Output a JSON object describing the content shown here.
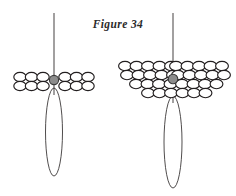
{
  "caption": {
    "text": "Figure 34"
  },
  "colors": {
    "background": "#ffffff",
    "ink": "#231f20",
    "bead_outline": "#231f20",
    "bead_fill": "#ffffff",
    "center_bead_fill": "#8c8c8c",
    "center_bead_outline": "#3a3a3a",
    "caption_text": "#2b2b2b"
  },
  "figures": [
    {
      "id": "left-figure",
      "name": "small-beadwork-motif",
      "stem": {
        "x": 54,
        "y_top": 13,
        "y_bottom": 95
      },
      "center_bead": {
        "cx": 54,
        "cy": 80,
        "r": 4.6
      },
      "loop": {
        "cx": 54,
        "cy": 132,
        "rx": 8.5,
        "ry": 44
      },
      "bead_rows": [
        {
          "row": 1,
          "cy": 77,
          "rx": 6.2,
          "ry": 4.6,
          "bead_count": 6,
          "centers_x": [
            20,
            31.5,
            43,
            65,
            76.5,
            88
          ]
        },
        {
          "row": 2,
          "cy": 86,
          "rx": 6.2,
          "ry": 4.6,
          "bead_count": 6,
          "centers_x": [
            20,
            31.5,
            43,
            65,
            76.5,
            88
          ]
        }
      ],
      "total_beads": 12
    },
    {
      "id": "right-figure",
      "name": "large-beadwork-motif",
      "stem": {
        "x": 173,
        "y_top": 13,
        "y_bottom": 103
      },
      "center_bead": {
        "cx": 173,
        "cy": 79,
        "r": 4.8
      },
      "loop": {
        "cx": 173,
        "cy": 142,
        "rx": 9,
        "ry": 46
      },
      "bead_rows": [
        {
          "row": 1,
          "cy": 66,
          "rx": 6.4,
          "ry": 4.7,
          "bead_count": 10,
          "centers_x": [
            125,
            136.5,
            148,
            159.5,
            171,
            176,
            187.5,
            199,
            210.5,
            222
          ]
        },
        {
          "row": 2,
          "cy": 75,
          "rx": 6.4,
          "ry": 4.7,
          "bead_count": 10,
          "centers_x": [
            127,
            138.5,
            150,
            161.5,
            173,
            178,
            189.5,
            201,
            212.5,
            224
          ]
        },
        {
          "row": 3,
          "cy": 84,
          "rx": 6.4,
          "ry": 4.7,
          "bead_count": 8,
          "centers_x": [
            136,
            147.5,
            159,
            170.5,
            182,
            193.5,
            205,
            216.5
          ]
        },
        {
          "row": 4,
          "cy": 93,
          "rx": 6.4,
          "ry": 4.7,
          "bead_count": 6,
          "centers_x": [
            148,
            159.5,
            171,
            182.5,
            194,
            205.5
          ]
        }
      ],
      "total_beads": 34
    }
  ]
}
